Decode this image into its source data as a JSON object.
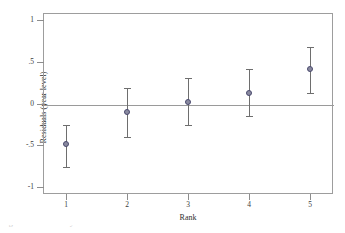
{
  "chart_data": {
    "type": "scatter",
    "title": "",
    "xlabel": "Rank",
    "ylabel": "Residuals (year level)",
    "categories": [
      "1",
      "2",
      "3",
      "4",
      "5"
    ],
    "x": [
      1,
      2,
      3,
      4,
      5
    ],
    "values": [
      -0.48,
      -0.1,
      0.02,
      0.12,
      0.41
    ],
    "error_low": [
      -0.76,
      -0.4,
      -0.26,
      -0.15,
      0.13
    ],
    "error_high": [
      -0.26,
      0.19,
      0.3,
      0.41,
      0.67
    ],
    "xlim": [
      0.62,
      5.38
    ],
    "ylim": [
      -1.08,
      1.08
    ],
    "xticks": [
      "1",
      "2",
      "3",
      "4",
      "5"
    ],
    "yticks": [
      "1",
      ".5",
      "0",
      "-.5",
      "-1"
    ],
    "ytick_values": [
      1,
      0.5,
      0,
      -0.5,
      -1
    ],
    "grid": false,
    "legend": "none",
    "reference_line": 0,
    "series": [
      {
        "name": "Residuals (year level)",
        "values": [
          -0.48,
          -0.1,
          0.02,
          0.12,
          0.41
        ]
      }
    ],
    "colors": {
      "marker_fill": "#8a8aa0",
      "marker_edge": "#4a4a6e",
      "errorbar": "#6e6e6e",
      "axis": "#9d9d9d",
      "reference_line": "#9a9a9a",
      "text": "#3a3a3a"
    }
  },
  "axes": {
    "y_title": "Residuals (year level)",
    "x_title": "Rank"
  },
  "caption": {
    "clipped_text": "Figure 3. Residuals by rank"
  }
}
